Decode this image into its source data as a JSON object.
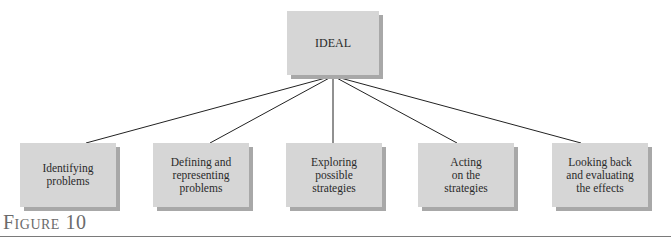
{
  "diagram": {
    "root": {
      "label": "IDEAL"
    },
    "children": [
      {
        "label": "Identifying\nproblems"
      },
      {
        "label": "Defining and\nrepresenting\nproblems"
      },
      {
        "label": "Exploring\npossible\nstrategies"
      },
      {
        "label": "Acting\non the\nstrategies"
      },
      {
        "label": "Looking back\nand evaluating\nthe effects"
      }
    ]
  },
  "figure": {
    "caption": "Figure 10"
  }
}
